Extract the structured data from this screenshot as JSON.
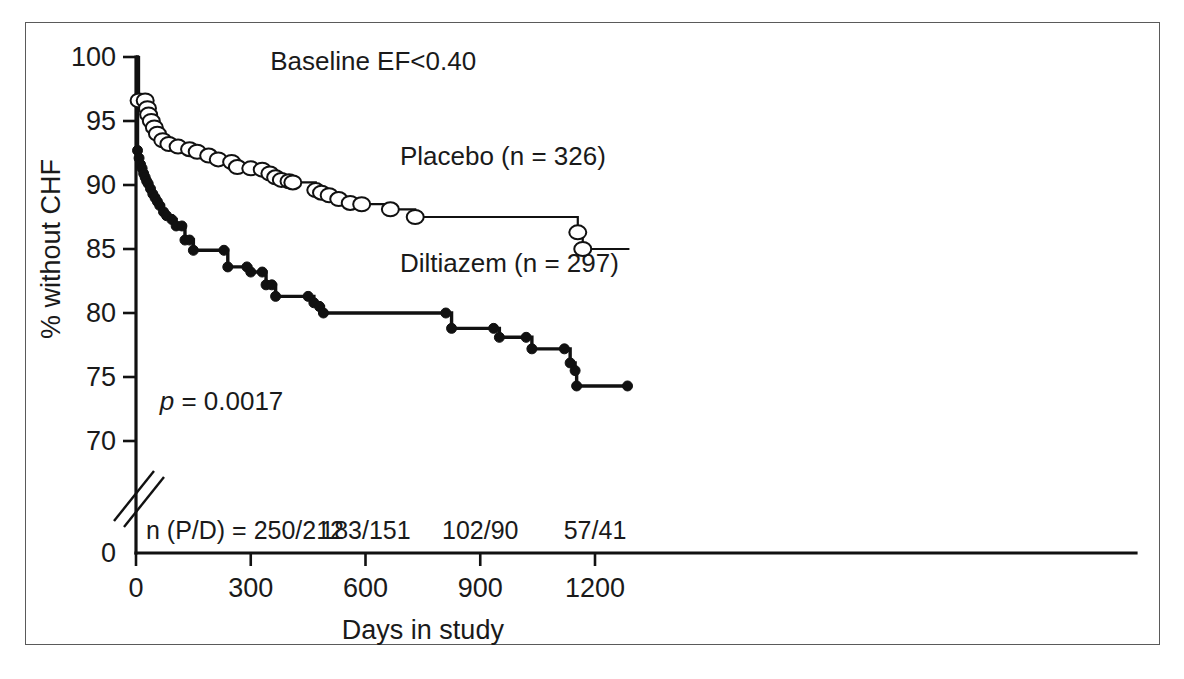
{
  "figure": {
    "title": "Baseline EF<0.40",
    "xlabel": "Days in study",
    "ylabel": "% without CHF",
    "pvalue": "p",
    "pvalue_rest": " = 0.0017"
  },
  "axes": {
    "y_ticks": [
      "100",
      "95",
      "90",
      "85",
      "80",
      "75",
      "70"
    ],
    "y_zero": "0",
    "x_ticks": [
      "0",
      "300",
      "600",
      "900",
      "1200"
    ],
    "y_break": true
  },
  "risk_table": {
    "prefix": "n (P/D) = 250/212",
    "entries": [
      "183/151",
      "102/90",
      "57/41"
    ],
    "entry_x": [
      600,
      900,
      1200
    ],
    "prefix_x": 285
  },
  "series_labels": {
    "placebo": "Placebo (n = 326)",
    "diltiazem": "Diltiazem (n = 297)"
  },
  "colors": {
    "line": "#111111",
    "marker_open_fill": "#ffffff",
    "frame": "#5a5a5a",
    "background": "#ffffff"
  },
  "chart_data": {
    "type": "line",
    "title": "Baseline EF<0.40",
    "xlabel": "Days in study",
    "ylabel": "% without CHF",
    "xlim": [
      0,
      1290
    ],
    "ylim": [
      68.5,
      100
    ],
    "grid": false,
    "legend": "inline-annotation",
    "annotations": [
      {
        "text": "p = 0.0017",
        "x": 155,
        "y": 72.6
      },
      {
        "text": "Baseline EF<0.40",
        "x": 600,
        "y": 99.2
      },
      {
        "text": "Placebo (n = 326)",
        "x": 700,
        "y": 92.0
      },
      {
        "text": "Diltiazem (n = 297)",
        "x": 700,
        "y": 83.6
      }
    ],
    "series": [
      {
        "name": "Placebo (n = 326)",
        "n": 326,
        "marker": "open-circle",
        "step": "post",
        "points": [
          [
            0,
            100.0
          ],
          [
            8,
            96.6
          ],
          [
            24,
            96.6
          ],
          [
            30,
            96.0
          ],
          [
            33,
            95.5
          ],
          [
            40,
            95.0
          ],
          [
            48,
            94.5
          ],
          [
            56,
            94.0
          ],
          [
            70,
            93.5
          ],
          [
            86,
            93.2
          ],
          [
            110,
            93.0
          ],
          [
            140,
            92.8
          ],
          [
            160,
            92.6
          ],
          [
            190,
            92.3
          ],
          [
            215,
            92.0
          ],
          [
            250,
            91.8
          ],
          [
            265,
            91.4
          ],
          [
            300,
            91.3
          ],
          [
            330,
            91.2
          ],
          [
            350,
            90.9
          ],
          [
            365,
            90.6
          ],
          [
            380,
            90.4
          ],
          [
            400,
            90.3
          ],
          [
            410,
            90.2
          ],
          [
            460,
            90.2
          ],
          [
            470,
            89.6
          ],
          [
            485,
            89.4
          ],
          [
            505,
            89.2
          ],
          [
            530,
            88.9
          ],
          [
            560,
            88.6
          ],
          [
            590,
            88.5
          ],
          [
            665,
            88.1
          ],
          [
            730,
            87.5
          ],
          [
            1140,
            87.5
          ],
          [
            1155,
            86.3
          ],
          [
            1168,
            85.0
          ],
          [
            1290,
            85.0
          ]
        ],
        "marker_points": [
          [
            8,
            96.6
          ],
          [
            24,
            96.6
          ],
          [
            30,
            96.0
          ],
          [
            33,
            95.5
          ],
          [
            40,
            95.0
          ],
          [
            48,
            94.5
          ],
          [
            56,
            94.0
          ],
          [
            70,
            93.5
          ],
          [
            86,
            93.2
          ],
          [
            110,
            93.0
          ],
          [
            140,
            92.8
          ],
          [
            160,
            92.6
          ],
          [
            190,
            92.3
          ],
          [
            215,
            92.0
          ],
          [
            250,
            91.8
          ],
          [
            265,
            91.4
          ],
          [
            300,
            91.3
          ],
          [
            330,
            91.2
          ],
          [
            350,
            90.9
          ],
          [
            365,
            90.6
          ],
          [
            380,
            90.4
          ],
          [
            400,
            90.3
          ],
          [
            410,
            90.2
          ],
          [
            470,
            89.6
          ],
          [
            485,
            89.4
          ],
          [
            505,
            89.2
          ],
          [
            530,
            88.9
          ],
          [
            560,
            88.6
          ],
          [
            590,
            88.5
          ],
          [
            665,
            88.1
          ],
          [
            730,
            87.5
          ],
          [
            1155,
            86.3
          ],
          [
            1168,
            85.0
          ]
        ]
      },
      {
        "name": "Diltiazem (n = 297)",
        "n": 297,
        "marker": "closed-circle",
        "step": "post",
        "points": [
          [
            0,
            100.0
          ],
          [
            4,
            92.7
          ],
          [
            8,
            92.1
          ],
          [
            12,
            91.6
          ],
          [
            16,
            91.3
          ],
          [
            20,
            90.9
          ],
          [
            24,
            90.6
          ],
          [
            28,
            90.3
          ],
          [
            32,
            90.1
          ],
          [
            38,
            89.7
          ],
          [
            44,
            89.3
          ],
          [
            50,
            89.0
          ],
          [
            56,
            88.7
          ],
          [
            62,
            88.4
          ],
          [
            72,
            87.9
          ],
          [
            80,
            87.6
          ],
          [
            94,
            87.3
          ],
          [
            105,
            86.8
          ],
          [
            120,
            86.8
          ],
          [
            128,
            85.7
          ],
          [
            140,
            85.7
          ],
          [
            150,
            84.9
          ],
          [
            230,
            84.9
          ],
          [
            240,
            83.6
          ],
          [
            290,
            83.6
          ],
          [
            300,
            83.2
          ],
          [
            330,
            83.2
          ],
          [
            340,
            82.2
          ],
          [
            355,
            82.2
          ],
          [
            365,
            81.3
          ],
          [
            450,
            81.3
          ],
          [
            465,
            80.8
          ],
          [
            480,
            80.5
          ],
          [
            490,
            80.0
          ],
          [
            810,
            80.0
          ],
          [
            825,
            78.8
          ],
          [
            935,
            78.8
          ],
          [
            950,
            78.1
          ],
          [
            1020,
            78.1
          ],
          [
            1035,
            77.2
          ],
          [
            1120,
            77.2
          ],
          [
            1135,
            76.1
          ],
          [
            1148,
            75.5
          ],
          [
            1152,
            74.3
          ],
          [
            1285,
            74.3
          ]
        ],
        "marker_points": [
          [
            4,
            92.7
          ],
          [
            8,
            92.1
          ],
          [
            12,
            91.6
          ],
          [
            16,
            91.3
          ],
          [
            20,
            90.9
          ],
          [
            24,
            90.6
          ],
          [
            28,
            90.3
          ],
          [
            32,
            90.1
          ],
          [
            38,
            89.7
          ],
          [
            44,
            89.3
          ],
          [
            50,
            89.0
          ],
          [
            56,
            88.7
          ],
          [
            62,
            88.4
          ],
          [
            72,
            87.9
          ],
          [
            80,
            87.6
          ],
          [
            94,
            87.3
          ],
          [
            105,
            86.8
          ],
          [
            120,
            86.8
          ],
          [
            128,
            85.7
          ],
          [
            140,
            85.7
          ],
          [
            150,
            84.9
          ],
          [
            230,
            84.9
          ],
          [
            240,
            83.6
          ],
          [
            290,
            83.6
          ],
          [
            300,
            83.2
          ],
          [
            330,
            83.2
          ],
          [
            340,
            82.2
          ],
          [
            355,
            82.2
          ],
          [
            365,
            81.3
          ],
          [
            450,
            81.3
          ],
          [
            465,
            80.8
          ],
          [
            480,
            80.5
          ],
          [
            490,
            80.0
          ],
          [
            810,
            80.0
          ],
          [
            825,
            78.8
          ],
          [
            935,
            78.8
          ],
          [
            950,
            78.1
          ],
          [
            1020,
            78.1
          ],
          [
            1035,
            77.2
          ],
          [
            1120,
            77.2
          ],
          [
            1135,
            76.1
          ],
          [
            1148,
            75.5
          ],
          [
            1152,
            74.3
          ],
          [
            1285,
            74.3
          ]
        ]
      }
    ]
  }
}
